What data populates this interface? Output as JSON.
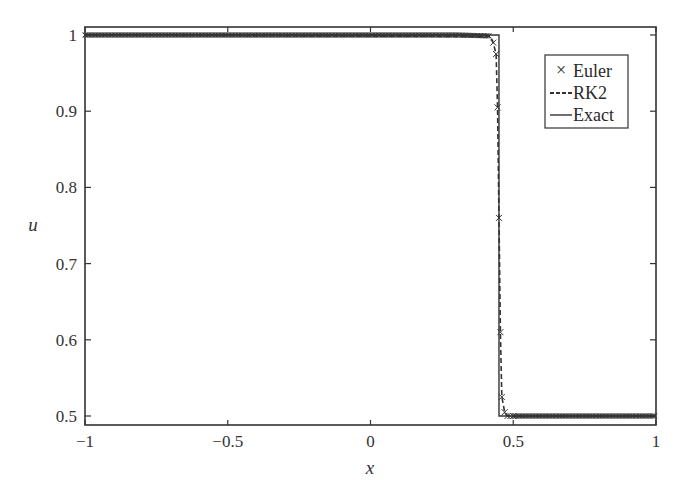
{
  "chart_data": {
    "type": "line",
    "title": "",
    "xlabel": "x",
    "ylabel": "u",
    "xlim": [
      -1,
      1
    ],
    "ylim": [
      0.49,
      1.01
    ],
    "grid": false,
    "legend_position": "upper right",
    "xticks": [
      -1,
      -0.5,
      0,
      0.5,
      1
    ],
    "xtick_labels": [
      "−1",
      "−0.5",
      "0",
      "0.5",
      "1"
    ],
    "yticks": [
      0.5,
      0.6,
      0.7,
      0.8,
      0.9,
      1
    ],
    "ytick_labels": [
      "0.5",
      "0.6",
      "0.7",
      "0.8",
      "0.9",
      "1"
    ],
    "series": [
      {
        "name": "Euler",
        "style": "markers-x",
        "description": "Dense x markers along u=1 for x<0.44, steep drop near x=0.44-0.49, then u=0.5 for x>0.49",
        "x": [
          -1.0,
          0.42,
          0.43,
          0.44,
          0.445,
          0.45,
          0.455,
          0.46,
          0.47,
          0.48,
          0.49,
          0.5,
          1.0
        ],
        "y": [
          1.0,
          0.998,
          0.99,
          0.975,
          0.905,
          0.76,
          0.61,
          0.525,
          0.505,
          0.5,
          0.5,
          0.5,
          0.5
        ]
      },
      {
        "name": "RK2",
        "style": "dashed",
        "x": [
          -1.0,
          0.42,
          0.43,
          0.44,
          0.445,
          0.45,
          0.455,
          0.46,
          0.47,
          0.48,
          0.49,
          0.5,
          1.0
        ],
        "y": [
          1.0,
          0.998,
          0.99,
          0.975,
          0.905,
          0.76,
          0.61,
          0.525,
          0.505,
          0.5,
          0.5,
          0.5,
          0.5
        ]
      },
      {
        "name": "Exact",
        "style": "solid",
        "x": [
          -1.0,
          0.45,
          0.45,
          1.0
        ],
        "y": [
          1.0,
          1.0,
          0.5,
          0.5
        ]
      }
    ]
  },
  "legend": {
    "items": [
      {
        "label": "Euler",
        "symbol": "×"
      },
      {
        "label": "RK2",
        "symbol": "dashed-line"
      },
      {
        "label": "Exact",
        "symbol": "solid-line"
      }
    ]
  },
  "colors": {
    "axis": "#333333",
    "series": "#333333",
    "background": "#ffffff"
  }
}
